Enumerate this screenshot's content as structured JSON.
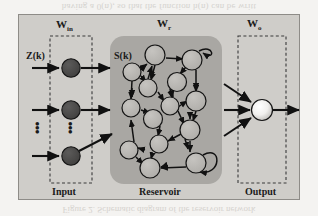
{
  "figure": {
    "background_color": "#cfcdc9",
    "page_color": "#f4f3f1",
    "reservoir_fill": "#a9a7a3",
    "input_node_color": "#4a4948",
    "reservoir_node_color": "#b9b7b3",
    "output_node_color": "#f2f1ef",
    "stroke_color": "#1a1a1a"
  },
  "bleed_text": {
    "top": "having a  0(n), so that  the function  h(n) can  be writt",
    "bottom": "Figure 2.  Schematic  diagram  of  the  reservoir  network"
  },
  "weight_labels": {
    "input": {
      "base": "W",
      "sub": "in"
    },
    "reservoir": {
      "base": "W",
      "sub": "r"
    },
    "output": {
      "base": "W",
      "sub": "o"
    }
  },
  "signal_labels": {
    "input_signal": "Z(k)",
    "state_signal": "S(k)"
  },
  "section_labels": {
    "input": "Input",
    "reservoir": "Reservoir",
    "output": "Output"
  },
  "ellipsis": {
    "glyph": "⠇",
    "count": 3
  },
  "input_layer": {
    "node_count": 3,
    "nodes": [
      {
        "id": "in1",
        "cx": 71,
        "cy": 68,
        "r": 9
      },
      {
        "id": "in2",
        "cx": 71,
        "cy": 110,
        "r": 9
      },
      {
        "id": "in3",
        "cx": 71,
        "cy": 156,
        "r": 9
      }
    ],
    "incoming_arrows": [
      {
        "x1": 32,
        "y1": 68,
        "x2": 60,
        "y2": 68
      },
      {
        "x1": 32,
        "y1": 110,
        "x2": 60,
        "y2": 110
      },
      {
        "x1": 32,
        "y1": 156,
        "x2": 60,
        "y2": 156
      }
    ],
    "outgoing_arrows": [
      {
        "x1": 81,
        "y1": 68,
        "x2": 112,
        "y2": 69
      },
      {
        "x1": 81,
        "y1": 110,
        "x2": 112,
        "y2": 110
      },
      {
        "x1": 81,
        "y1": 152,
        "x2": 114,
        "y2": 136
      }
    ],
    "dashed_box": {
      "x": 50,
      "y": 36,
      "w": 42,
      "h": 147
    }
  },
  "reservoir": {
    "panel": {
      "x": 110,
      "y": 36,
      "w": 112,
      "h": 148,
      "radius": 14
    },
    "node_count": 16,
    "nodes": [
      {
        "id": "r1",
        "cx": 132,
        "cy": 72,
        "r": 9
      },
      {
        "id": "r2",
        "cx": 155,
        "cy": 55,
        "r": 10
      },
      {
        "id": "r3",
        "cx": 192,
        "cy": 60,
        "r": 10
      },
      {
        "id": "r4",
        "cx": 148,
        "cy": 88,
        "r": 9
      },
      {
        "id": "r5",
        "cx": 177,
        "cy": 82,
        "r": 9
      },
      {
        "id": "r6",
        "cx": 131,
        "cy": 108,
        "r": 9
      },
      {
        "id": "r7",
        "cx": 170,
        "cy": 106,
        "r": 9
      },
      {
        "id": "r8",
        "cx": 196,
        "cy": 101,
        "r": 10
      },
      {
        "id": "r9",
        "cx": 153,
        "cy": 119,
        "r": 9
      },
      {
        "id": "r10",
        "cx": 190,
        "cy": 130,
        "r": 10
      },
      {
        "id": "r11",
        "cx": 159,
        "cy": 144,
        "r": 9
      },
      {
        "id": "r12",
        "cx": 129,
        "cy": 150,
        "r": 9
      },
      {
        "id": "r13",
        "cx": 150,
        "cy": 168,
        "r": 10
      },
      {
        "id": "r14",
        "cx": 196,
        "cy": 163,
        "r": 10
      },
      {
        "id": "r15",
        "cx": 177,
        "cy": 62,
        "r": 0
      },
      {
        "id": "r16",
        "cx": 177,
        "cy": 62,
        "r": 0
      }
    ],
    "self_loops": [
      {
        "node": "r3",
        "side": "right-top"
      },
      {
        "node": "r14",
        "side": "right-bottom"
      }
    ],
    "edge_count": 18
  },
  "output_layer": {
    "node": {
      "cx": 262,
      "cy": 110,
      "r": 10
    },
    "incoming_arrows": [
      {
        "x1": 222,
        "y1": 84,
        "x2": 252,
        "y2": 103
      },
      {
        "x1": 224,
        "y1": 110,
        "x2": 250,
        "y2": 110
      },
      {
        "x1": 222,
        "y1": 136,
        "x2": 252,
        "y2": 117
      }
    ],
    "outgoing_arrow": {
      "x1": 272,
      "y1": 110,
      "x2": 300,
      "y2": 110
    },
    "dashed_box": {
      "x": 238,
      "y": 36,
      "w": 48,
      "h": 147
    }
  }
}
